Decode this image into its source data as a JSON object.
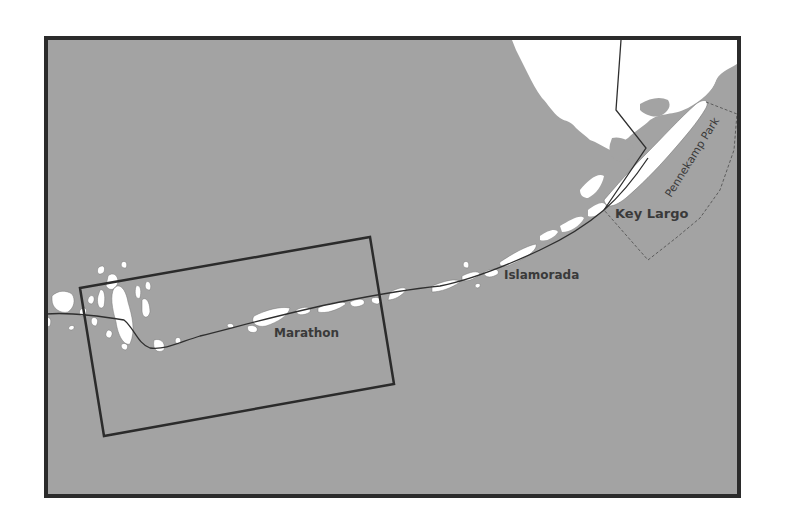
{
  "map": {
    "colors": {
      "water": "#a3a3a3",
      "land": "#ffffff",
      "frame": "#2b2b2b",
      "road": "#2f2f2f",
      "label": "#3a3a3a",
      "park_boundary": "#555555"
    },
    "labels": {
      "key_largo": "Key Largo",
      "islamorada": "Islamorada",
      "marathon": "Marathon",
      "pennekamp_park": "Pennekamp Park"
    },
    "features": {
      "mainland": "Florida mainland",
      "road": "Overseas Highway",
      "inset": "Inset area rectangle",
      "park": "Pennekamp Park boundary"
    }
  }
}
